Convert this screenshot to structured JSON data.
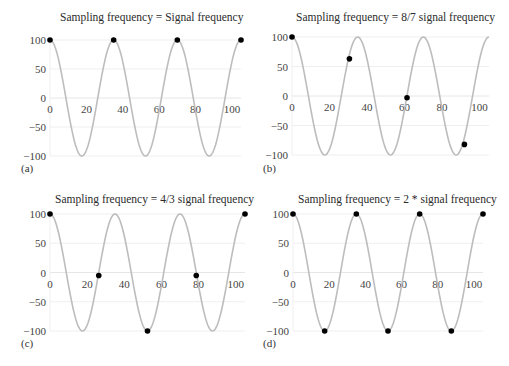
{
  "chart_data": [
    {
      "id": "a",
      "type": "line",
      "panel_label": "(a)",
      "title": "Sampling frequency = Signal frequency",
      "xlabel": "",
      "ylabel": "",
      "xlim": [
        0,
        105
      ],
      "ylim": [
        -100,
        100
      ],
      "xticks": [
        0,
        20,
        40,
        60,
        80,
        100
      ],
      "yticks": [
        100,
        50,
        0,
        -50,
        -100
      ],
      "ytick_labels": [
        "100",
        "50",
        "0",
        "−50",
        "−100"
      ],
      "grid": true,
      "series": [
        {
          "name": "signal",
          "kind": "cosine",
          "amplitude": 100,
          "period": 35,
          "color": "#bdbdbd"
        },
        {
          "name": "samples",
          "kind": "scatter",
          "color": "#000000",
          "x": [
            0,
            35,
            70,
            105
          ],
          "y": [
            100,
            100,
            100,
            100
          ]
        }
      ],
      "layout": {
        "left": 50,
        "top": 40,
        "right": 241,
        "bottom": 156,
        "xmax_px_value": 105
      }
    },
    {
      "id": "b",
      "type": "line",
      "panel_label": "(b)",
      "title": "Sampling frequency = 8/7 signal frequency",
      "xlabel": "",
      "ylabel": "",
      "xlim": [
        0,
        105
      ],
      "ylim": [
        -100,
        100
      ],
      "xticks": [
        0,
        20,
        40,
        60,
        80,
        100
      ],
      "yticks": [
        100,
        50,
        0,
        -50,
        -100
      ],
      "ytick_labels": [
        "100",
        "50",
        "0",
        "−50",
        "−100"
      ],
      "grid": true,
      "series": [
        {
          "name": "signal",
          "kind": "cosine",
          "amplitude": 100,
          "period": 35,
          "color": "#bdbdbd"
        },
        {
          "name": "samples",
          "kind": "scatter",
          "color": "#000000",
          "x": [
            0,
            30.6,
            61.3,
            91.9
          ],
          "y": [
            100,
            63,
            -3,
            -82
          ]
        }
      ],
      "layout": {
        "left": 292,
        "top": 37,
        "right": 489,
        "bottom": 155,
        "xmax_px_value": 105
      }
    },
    {
      "id": "c",
      "type": "line",
      "panel_label": "(c)",
      "title": "Sampling frequency = 4/3 signal frequency",
      "xlabel": "",
      "ylabel": "",
      "xlim": [
        0,
        105
      ],
      "ylim": [
        -100,
        100
      ],
      "xticks": [
        0,
        20,
        40,
        60,
        80,
        100
      ],
      "yticks": [
        100,
        50,
        0,
        -50,
        -100
      ],
      "ytick_labels": [
        "100",
        "50",
        "0",
        "−50",
        "−100"
      ],
      "grid": true,
      "series": [
        {
          "name": "signal",
          "kind": "cosine",
          "amplitude": 100,
          "period": 35,
          "color": "#bdbdbd"
        },
        {
          "name": "samples",
          "kind": "scatter",
          "color": "#000000",
          "x": [
            0,
            26.25,
            52.5,
            78.75,
            105
          ],
          "y": [
            100,
            -5,
            -100,
            -5,
            100
          ]
        }
      ],
      "layout": {
        "left": 50,
        "top": 214,
        "right": 245,
        "bottom": 331,
        "xmax_px_value": 105
      }
    },
    {
      "id": "d",
      "type": "line",
      "panel_label": "(d)",
      "title": "Sampling frequency = 2 * signal frequency",
      "xlabel": "",
      "ylabel": "",
      "xlim": [
        0,
        105
      ],
      "ylim": [
        -100,
        100
      ],
      "xticks": [
        0,
        20,
        40,
        60,
        80,
        100
      ],
      "yticks": [
        100,
        50,
        0,
        -50,
        -100
      ],
      "ytick_labels": [
        "100",
        "50",
        "0",
        "−50",
        "−100"
      ],
      "grid": true,
      "series": [
        {
          "name": "signal",
          "kind": "cosine",
          "amplitude": 100,
          "period": 35,
          "color": "#bdbdbd"
        },
        {
          "name": "samples",
          "kind": "scatter",
          "color": "#000000",
          "x": [
            0,
            17.5,
            35,
            52.5,
            70,
            87.5,
            105
          ],
          "y": [
            100,
            -100,
            100,
            -100,
            100,
            -100,
            100
          ]
        }
      ],
      "layout": {
        "left": 293,
        "top": 214,
        "right": 483,
        "bottom": 331,
        "xmax_px_value": 105
      }
    }
  ],
  "panels": {
    "a": {
      "title": "Sampling frequency = Signal frequency",
      "label": "(a)"
    },
    "b": {
      "title": "Sampling frequency = 8/7 signal frequency",
      "label": "(b)"
    },
    "c": {
      "title": "Sampling frequency = 4/3 signal frequency",
      "label": "(c)"
    },
    "d": {
      "title": "Sampling frequency = 2 * signal frequency",
      "label": "(d)"
    }
  },
  "style": {
    "grid_color": "#efefef",
    "axis_color": "#e6e6e6",
    "signal_color": "#bdbdbd",
    "sample_color": "#000000"
  }
}
